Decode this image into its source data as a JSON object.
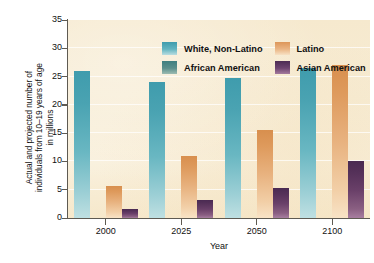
{
  "chart_data": {
    "type": "bar",
    "title": "",
    "xlabel": "Year",
    "ylabel": "Actual and projected number of\nindividuals from 10–19 years of age\nin millions",
    "categories": [
      "2000",
      "2025",
      "2050",
      "2100"
    ],
    "ylim": [
      0,
      35
    ],
    "yticks": [
      0,
      5,
      10,
      15,
      20,
      25,
      30,
      35
    ],
    "ytick_labels": [
      "0",
      "5",
      "10",
      "15",
      "20",
      "25",
      "30",
      "35"
    ],
    "grid": true,
    "legend_position": "top-left-inside",
    "series": [
      {
        "name": "White, Non-Latino",
        "color": "#4aa3b2",
        "values": [
          26.0,
          24.1,
          24.8,
          26.5
        ]
      },
      {
        "name": "African American",
        "color": "#3f7f80",
        "values": [
          5.7,
          6.3,
          7.2,
          9.5
        ]
      },
      {
        "name": "Latino",
        "color": "#e0a066",
        "values": [
          5.6,
          11.0,
          15.6,
          27.0
        ]
      },
      {
        "name": "Asian American",
        "color": "#5b3560",
        "values": [
          1.6,
          3.1,
          5.3,
          10.1
        ]
      }
    ]
  },
  "legend": {
    "items": [
      {
        "label": "White, Non-Latino"
      },
      {
        "label": "Latino"
      },
      {
        "label": "African American"
      },
      {
        "label": "Asian American"
      }
    ]
  },
  "colors": {
    "plot_background": "#f7ecd4",
    "axis": "#5e5a52",
    "gridline": "#ffffff",
    "page_background": "#ffffff"
  }
}
